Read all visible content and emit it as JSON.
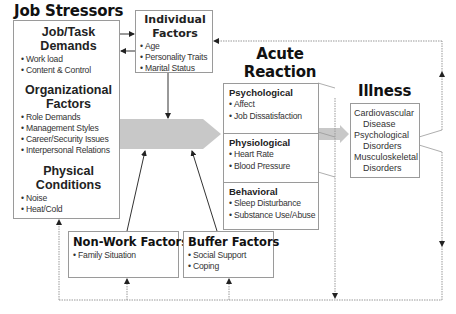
{
  "title": "Job Stressors",
  "job_stressors": {
    "groups": [
      {
        "heading": [
          "Job/Task",
          "Demands"
        ],
        "items": [
          "Work load",
          "Content & Control"
        ]
      },
      {
        "heading": [
          "Organizational",
          "Factors"
        ],
        "items": [
          "Role Demands",
          "Management Styles",
          "Career/Security Issues",
          "Interpersonal Relations"
        ]
      },
      {
        "heading": [
          "Physical",
          "Conditions"
        ],
        "items": [
          "Noise",
          "Heat/Cold"
        ]
      }
    ]
  },
  "individual_factors": {
    "heading": [
      "Individual",
      "Factors"
    ],
    "items": [
      "Age",
      "Personality Traits",
      "Marital Status"
    ]
  },
  "acute_reaction": {
    "heading": [
      "Acute",
      "Reaction"
    ],
    "sections": [
      {
        "heading": "Psychological",
        "items": [
          "Affect",
          "Job Dissatisfaction"
        ]
      },
      {
        "heading": "Physiological",
        "items": [
          "Heart Rate",
          "Blood Pressure"
        ]
      },
      {
        "heading": "Behavioral",
        "items": [
          "Sleep Disturbance",
          "Substance Use/Abuse"
        ]
      }
    ]
  },
  "illness": {
    "heading": "Illness",
    "items": [
      {
        "line1": "Cardiovascular",
        "line2": "Disease"
      },
      {
        "line1": "Psychological",
        "line2": "Disorders"
      },
      {
        "line1": "Musculoskeletal",
        "line2": "Disorders"
      }
    ]
  },
  "non_work_factors": {
    "heading": "Non-Work Factors",
    "items": [
      "Family Situation"
    ]
  },
  "buffer_factors": {
    "heading": "Buffer Factors",
    "items": [
      "Social Support",
      "Coping"
    ]
  },
  "colors": {
    "box_border": "#9a9a9a",
    "main_arrow": "#c8c8c8",
    "lines": "#333333",
    "dotted": "#8a8a8a"
  }
}
